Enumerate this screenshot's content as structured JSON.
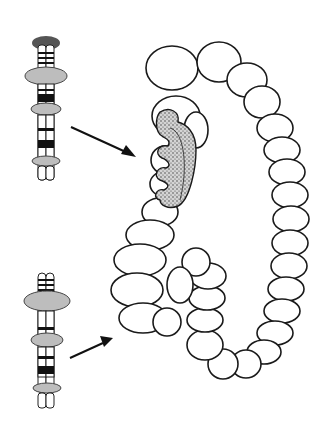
{
  "figure": {
    "colors": {
      "background": "#ffffff",
      "outline": "#1a1a1a",
      "disc_gray": "#bdbdbd",
      "cap_dark": "#555555",
      "band_black": "#111111",
      "polyp_fill": "#cfcfcf"
    },
    "chromosomes": [
      {
        "id": "top",
        "has_dark_cap": true,
        "discs": 3,
        "points_to": "polyp"
      },
      {
        "id": "bottom",
        "has_dark_cap": false,
        "discs": 3,
        "points_to": "lower-colon"
      }
    ],
    "arrows": [
      {
        "from": "top-chromosome",
        "to": "polyp"
      },
      {
        "from": "bottom-chromosome",
        "to": "lower-colon"
      }
    ]
  }
}
